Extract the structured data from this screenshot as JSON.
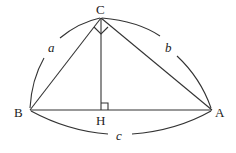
{
  "diagram": {
    "type": "geometry",
    "points": {
      "C": {
        "label": "C",
        "x": 101,
        "y": 18
      },
      "B": {
        "label": "B",
        "x": 30,
        "y": 110
      },
      "A": {
        "label": "A",
        "x": 212,
        "y": 110
      },
      "H": {
        "label": "H",
        "x": 101,
        "y": 110
      }
    },
    "sides": {
      "a": {
        "label": "a",
        "from": "B",
        "to": "C"
      },
      "b": {
        "label": "b",
        "from": "C",
        "to": "A"
      },
      "c": {
        "label": "c",
        "from": "B",
        "to": "A"
      }
    },
    "right_angles": [
      "C",
      "H"
    ]
  }
}
